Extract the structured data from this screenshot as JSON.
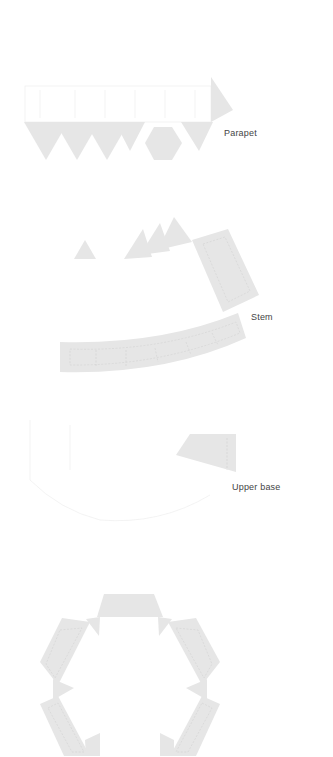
{
  "diagram": {
    "type": "paper-model-template",
    "fill_color": "#e6e6e6",
    "label_color": "#444444",
    "parts": [
      {
        "id": "parapet",
        "label": "Parapet"
      },
      {
        "id": "stem",
        "label": "Stem"
      },
      {
        "id": "upper-base",
        "label": "Upper base"
      },
      {
        "id": "lower-base",
        "label": ""
      }
    ]
  }
}
